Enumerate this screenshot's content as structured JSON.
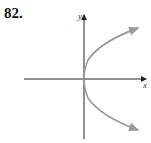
{
  "problem_number": "82.",
  "axes": {
    "x_label": "x",
    "y_label": "y"
  },
  "curve": {
    "description": "parabola opening right with vertex at origin",
    "equation_shape": "x = y^2",
    "color": "#999999"
  },
  "axis_color": "#222222"
}
